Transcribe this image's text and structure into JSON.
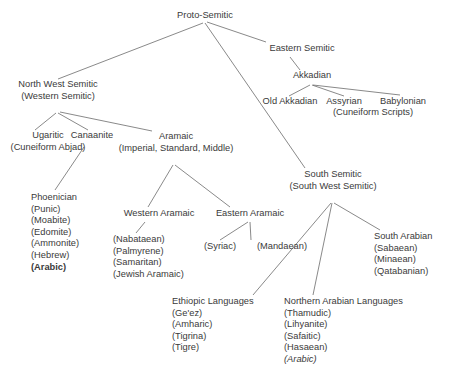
{
  "diagram": {
    "type": "tree",
    "background_color": "#ffffff",
    "text_color": "#3a3a3a",
    "line_color": "#6b6b6b",
    "nodes": [
      {
        "id": "proto-semitic",
        "lines": [
          {
            "text": "Proto-Semitic",
            "style": "normal"
          }
        ]
      },
      {
        "id": "north-west-semitic",
        "lines": [
          {
            "text": "North West Semitic",
            "style": "normal"
          },
          {
            "text": "(Western Semitic)",
            "style": "normal"
          }
        ]
      },
      {
        "id": "eastern-semitic",
        "lines": [
          {
            "text": "Eastern Semitic",
            "style": "normal"
          }
        ]
      },
      {
        "id": "akkadian",
        "lines": [
          {
            "text": "Akkadian",
            "style": "normal"
          }
        ]
      },
      {
        "id": "old-akkadian",
        "lines": [
          {
            "text": "Old Akkadian",
            "style": "normal"
          }
        ]
      },
      {
        "id": "assyrian",
        "lines": [
          {
            "text": "Assyrian",
            "style": "normal"
          }
        ]
      },
      {
        "id": "babylonian",
        "lines": [
          {
            "text": "Babylonian",
            "style": "normal"
          }
        ]
      },
      {
        "id": "cuneiform-scripts",
        "lines": [
          {
            "text": "(Cuneiform Scripts)",
            "style": "normal"
          }
        ]
      },
      {
        "id": "ugaritic",
        "lines": [
          {
            "text": "Ugaritic",
            "style": "normal"
          },
          {
            "text": "(Cuneiform Abjad)",
            "style": "normal"
          }
        ]
      },
      {
        "id": "canaanite",
        "lines": [
          {
            "text": "Canaanite",
            "style": "normal"
          }
        ]
      },
      {
        "id": "aramaic",
        "lines": [
          {
            "text": "Aramaic",
            "style": "normal"
          },
          {
            "text": "(Imperial, Standard, Middle)",
            "style": "normal"
          }
        ]
      },
      {
        "id": "phoenician",
        "lines": [
          {
            "text": "Phoenician",
            "style": "normal"
          },
          {
            "text": "(Punic)",
            "style": "normal"
          },
          {
            "text": "(Moabite)",
            "style": "normal"
          },
          {
            "text": "(Edomite)",
            "style": "normal"
          },
          {
            "text": "(Ammonite)",
            "style": "normal"
          },
          {
            "text": "(Hebrew)",
            "style": "normal"
          },
          {
            "text": "(Arabic)",
            "style": "bold"
          }
        ]
      },
      {
        "id": "western-aramaic",
        "lines": [
          {
            "text": "Western Aramaic",
            "style": "normal"
          }
        ]
      },
      {
        "id": "western-aramaic-list",
        "lines": [
          {
            "text": "(Nabataean)",
            "style": "normal"
          },
          {
            "text": "(Palmyrene)",
            "style": "normal"
          },
          {
            "text": "(Samaritan)",
            "style": "normal"
          },
          {
            "text": "(Jewish Aramaic)",
            "style": "normal"
          }
        ]
      },
      {
        "id": "eastern-aramaic",
        "lines": [
          {
            "text": "Eastern Aramaic",
            "style": "normal"
          }
        ]
      },
      {
        "id": "syriac",
        "lines": [
          {
            "text": "(Syriac)",
            "style": "normal"
          }
        ]
      },
      {
        "id": "mandaean",
        "lines": [
          {
            "text": "(Mandaean)",
            "style": "normal"
          }
        ]
      },
      {
        "id": "south-semitic",
        "lines": [
          {
            "text": "South Semitic",
            "style": "normal"
          },
          {
            "text": "(South West Semitic)",
            "style": "normal"
          }
        ]
      },
      {
        "id": "south-arabian",
        "lines": [
          {
            "text": "South Arabian",
            "style": "normal"
          },
          {
            "text": "(Sabaean)",
            "style": "normal"
          },
          {
            "text": "(Minaean)",
            "style": "normal"
          },
          {
            "text": "(Qatabanian)",
            "style": "normal"
          }
        ]
      },
      {
        "id": "ethiopic-languages",
        "lines": [
          {
            "text": "Ethiopic Languages",
            "style": "normal"
          },
          {
            "text": "(Ge'ez)",
            "style": "normal"
          },
          {
            "text": "(Amharic)",
            "style": "normal"
          },
          {
            "text": "(Tigrina)",
            "style": "normal"
          },
          {
            "text": "(Tigre)",
            "style": "normal"
          }
        ]
      },
      {
        "id": "northern-arabian-languages",
        "lines": [
          {
            "text": "Northern Arabian Languages",
            "style": "normal"
          },
          {
            "text": "(Thamudic)",
            "style": "normal"
          },
          {
            "text": "(Lihyanite)",
            "style": "normal"
          },
          {
            "text": "(Safaitic)",
            "style": "normal"
          },
          {
            "text": "(Hasaean)",
            "style": "normal"
          },
          {
            "text": "(Arabic)",
            "style": "italic"
          }
        ]
      }
    ],
    "edges": [
      {
        "from": "proto-semitic",
        "to": "north-west-semitic"
      },
      {
        "from": "proto-semitic",
        "to": "south-semitic"
      },
      {
        "from": "proto-semitic",
        "to": "eastern-semitic"
      },
      {
        "from": "eastern-semitic",
        "to": "akkadian"
      },
      {
        "from": "akkadian",
        "to": "old-akkadian"
      },
      {
        "from": "akkadian",
        "to": "assyrian"
      },
      {
        "from": "akkadian",
        "to": "babylonian"
      },
      {
        "from": "north-west-semitic",
        "to": "ugaritic"
      },
      {
        "from": "north-west-semitic",
        "to": "canaanite"
      },
      {
        "from": "north-west-semitic",
        "to": "aramaic"
      },
      {
        "from": "canaanite",
        "to": "phoenician"
      },
      {
        "from": "aramaic",
        "to": "western-aramaic"
      },
      {
        "from": "aramaic",
        "to": "eastern-aramaic"
      },
      {
        "from": "western-aramaic",
        "to": "western-aramaic-list"
      },
      {
        "from": "eastern-aramaic",
        "to": "syriac"
      },
      {
        "from": "eastern-aramaic",
        "to": "mandaean"
      },
      {
        "from": "south-semitic",
        "to": "ethiopic-languages"
      },
      {
        "from": "south-semitic",
        "to": "northern-arabian-languages"
      },
      {
        "from": "south-semitic",
        "to": "south-arabian"
      }
    ]
  }
}
